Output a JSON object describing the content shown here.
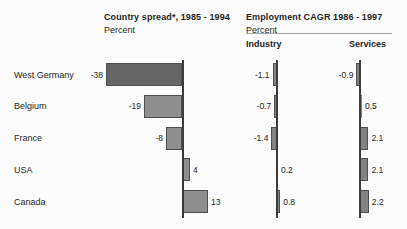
{
  "figure": {
    "background": "#fcfcfc"
  },
  "chart_data": [
    {
      "type": "bar",
      "orientation": "horizontal",
      "title": "Country spread*, 1985 - 1994",
      "units": "Percent",
      "categories": [
        "West Germany",
        "Belgium",
        "France",
        "USA",
        "Canada"
      ],
      "values": [
        -38,
        -19,
        -8,
        4,
        13
      ],
      "xlim": [
        -40,
        15
      ],
      "highlighted_category": "West Germany",
      "value_labels_shown": true,
      "grid": false
    },
    {
      "type": "bar",
      "orientation": "horizontal",
      "title": "Employment CAGR 1986 - 1997",
      "units": "Percent",
      "categories": [
        "West Germany",
        "Belgium",
        "France",
        "USA",
        "Canada"
      ],
      "series": [
        {
          "name": "Industry",
          "values": [
            -1.1,
            -0.7,
            -1.4,
            0.2,
            0.8
          ]
        },
        {
          "name": "Services",
          "values": [
            -0.9,
            0.5,
            2.1,
            2.1,
            2.2
          ]
        }
      ],
      "xlim": [
        -2,
        3
      ],
      "value_labels_shown": true,
      "grid": false
    }
  ],
  "colors": {
    "bar": "#8e8e8e",
    "bar_highlight": "#656565",
    "mini_bar": "#838383",
    "bar_border": "#4f4f4f",
    "axis": "#3c3c3c",
    "rule": "#a6a6a6",
    "text": "#1e1e1e"
  }
}
